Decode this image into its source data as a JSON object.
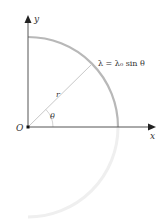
{
  "diagram": {
    "axis_labels": {
      "y": "y",
      "x": "x",
      "origin": "O"
    },
    "radius_label": "r",
    "angle_label": "θ",
    "equation": "λ = λ₀ sin θ",
    "colors": {
      "axis": "#333333",
      "arc": "#b8b8b8",
      "arc_faded": "#ececec",
      "radius_line": "#c8c8c8",
      "text": "#333333"
    },
    "geometry": {
      "origin": [
        28,
        127
      ],
      "radius": 90,
      "angle_deg": 45
    }
  }
}
